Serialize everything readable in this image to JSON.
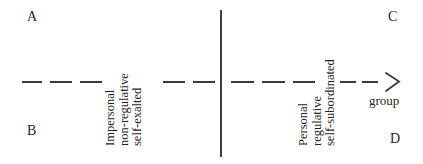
{
  "diagram": {
    "type": "axis-continuum",
    "width": 423,
    "height": 164,
    "background": "#ffffff",
    "ink_color": "#2b2b2b",
    "corners": {
      "top_left": "A",
      "bottom_left": "B",
      "top_right": "C",
      "bottom_right": "D"
    },
    "axis": {
      "orientation": "horizontal",
      "style": "dashed",
      "y": 81,
      "dash_segments": [
        {
          "x": 22,
          "width": 20
        },
        {
          "x": 50,
          "width": 22
        },
        {
          "x": 80,
          "width": 22
        },
        {
          "x": 163,
          "width": 22
        },
        {
          "x": 193,
          "width": 22
        },
        {
          "x": 231,
          "width": 23
        },
        {
          "x": 262,
          "width": 23
        },
        {
          "x": 293,
          "width": 22
        },
        {
          "x": 340,
          "width": 16
        },
        {
          "x": 362,
          "width": 16
        }
      ],
      "arrow": {
        "present": true,
        "direction": "right",
        "caption": "group"
      }
    },
    "divider": {
      "orientation": "vertical",
      "x": 220,
      "top": 10,
      "bottom": 157,
      "style": "solid"
    },
    "labels": [
      {
        "id": "left-pole",
        "orientation": "rotated-90-ccw",
        "lines": [
          "Impersonal",
          "non-regulative",
          "self-exalted"
        ]
      },
      {
        "id": "right-pole",
        "orientation": "rotated-90-ccw",
        "lines": [
          "Personal",
          "regulative",
          "self-subordinated"
        ]
      }
    ]
  },
  "chart_data": {
    "type": "diagram",
    "title": "",
    "categories": [
      "A",
      "B",
      "C",
      "D"
    ],
    "annotations": [
      "Impersonal non-regulative self-exalted",
      "Personal regulative self-subordinated",
      "group"
    ]
  }
}
